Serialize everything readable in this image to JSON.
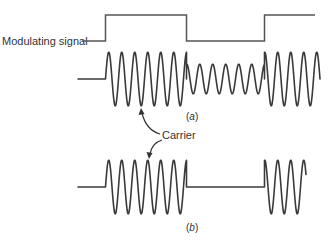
{
  "figure": {
    "type": "modulation-waveforms",
    "modulating_signal_label": "Modulating signal",
    "carrier_label": "Carrier",
    "panel_a_label": {
      "open": "(",
      "letter": "a",
      "close": ")"
    },
    "panel_b_label": {
      "open": "(",
      "letter": "b",
      "close": ")"
    },
    "line_color": "#3a3a3a",
    "modulating_color": "#555555",
    "modulating_signal": {
      "description": "Binary square wave: low, high, low, high",
      "levels": [
        "low",
        "high",
        "low",
        "high"
      ]
    },
    "waveform_a": {
      "description": "Amplitude-shift keyed carrier: full amplitude when modulating signal is high, reduced amplitude when low",
      "segments": [
        {
          "state": "idle",
          "relative_amplitude": 0
        },
        {
          "state": "high",
          "relative_amplitude": 1.0
        },
        {
          "state": "low",
          "relative_amplitude": 0.55
        },
        {
          "state": "high",
          "relative_amplitude": 1.0
        }
      ]
    },
    "waveform_b": {
      "description": "On-off keyed carrier: full amplitude when high, zero when low",
      "segments": [
        {
          "state": "idle",
          "relative_amplitude": 0
        },
        {
          "state": "high",
          "relative_amplitude": 1.0
        },
        {
          "state": "low",
          "relative_amplitude": 0
        },
        {
          "state": "high",
          "relative_amplitude": 1.0
        }
      ]
    }
  }
}
